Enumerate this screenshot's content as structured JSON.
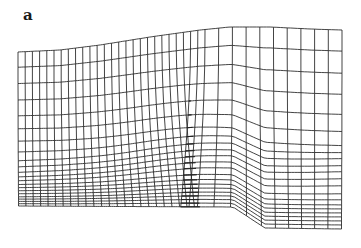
{
  "figure": {
    "panel_label": "a",
    "line_color": "#222222",
    "background": "#ffffff",
    "mesh": {
      "top_boundary": [
        [
          18,
          52
        ],
        [
          60,
          50
        ],
        [
          100,
          45
        ],
        [
          150,
          37
        ],
        [
          200,
          30
        ],
        [
          230,
          27
        ],
        [
          270,
          27
        ],
        [
          310,
          29
        ],
        [
          342,
          30
        ]
      ],
      "bottom_boundary": [
        [
          18,
          206
        ],
        [
          233,
          207
        ],
        [
          265,
          228
        ],
        [
          342,
          229
        ]
      ],
      "left_edge_rows_y": [
        52,
        72,
        94,
        115,
        132,
        148,
        160,
        168,
        175,
        180,
        185,
        189,
        193,
        197,
        200,
        203,
        206
      ],
      "right_edge_rows_y": [
        30,
        51,
        73,
        94,
        114,
        131,
        145,
        152,
        158,
        165,
        171,
        178,
        185,
        193,
        199,
        204,
        208,
        212,
        216,
        220,
        224,
        228
      ],
      "columns_dense": 27,
      "columns_sparse": 10,
      "dense_region_end_x": 205,
      "bump_center_x": 190,
      "bump_center_y": 195
    }
  }
}
